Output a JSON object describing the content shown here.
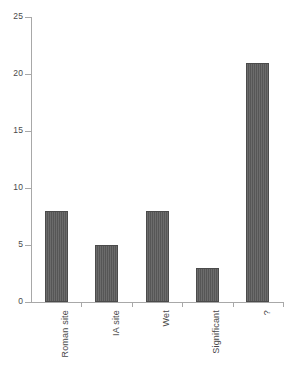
{
  "chart_data": {
    "type": "bar",
    "title": "",
    "subtitle": "",
    "xlabel": "",
    "ylabel": "",
    "categories": [
      "Roman site",
      "IA site",
      "Wet",
      "Significant",
      "?"
    ],
    "values": [
      8,
      5,
      8,
      3,
      21
    ],
    "ylim": [
      0,
      25
    ],
    "yticks": [
      0,
      5,
      10,
      15,
      20,
      25
    ],
    "ytick_labels": [
      "0",
      "5",
      "10",
      "15",
      "20",
      "25"
    ],
    "grid": false,
    "legend": false,
    "legend_position": "none",
    "orientation": "vertical",
    "x_tick_label_rotation": 90,
    "colors": {
      "bar_fill": "#5b5b5b",
      "bar_edge": "#4b4b4b",
      "axis": "#a8a8a8",
      "text": "#4a4a4a",
      "background": "#ffffff"
    }
  },
  "axes": {
    "y_axis_name": "y-axis",
    "x_axis_name": "x-axis"
  }
}
